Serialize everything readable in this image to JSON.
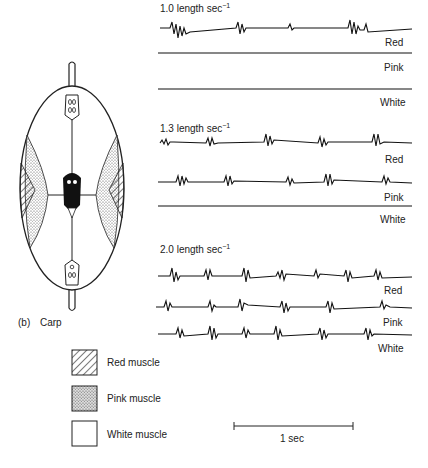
{
  "panel_label": "(b)",
  "fish_name": "Carp",
  "speeds": [
    {
      "label": "1.0 length sec",
      "sup": "−1",
      "traces": [
        {
          "name": "Red",
          "active": true
        },
        {
          "name": "Pink",
          "active": false
        },
        {
          "name": "White",
          "active": false
        }
      ]
    },
    {
      "label": "1.3 length sec",
      "sup": "−1",
      "traces": [
        {
          "name": "Red",
          "active": true
        },
        {
          "name": "Pink",
          "active": true
        },
        {
          "name": "White",
          "active": false
        }
      ]
    },
    {
      "label": "2.0 length sec",
      "sup": "−1",
      "traces": [
        {
          "name": "Red",
          "active": true
        },
        {
          "name": "Pink",
          "active": true
        },
        {
          "name": "White",
          "active": true
        }
      ]
    }
  ],
  "legend": [
    {
      "label": "Red muscle",
      "pattern": "hatched"
    },
    {
      "label": "Pink muscle",
      "pattern": "stippled"
    },
    {
      "label": "White muscle",
      "pattern": "blank"
    }
  ],
  "scale_bar": {
    "label": "1 sec"
  }
}
